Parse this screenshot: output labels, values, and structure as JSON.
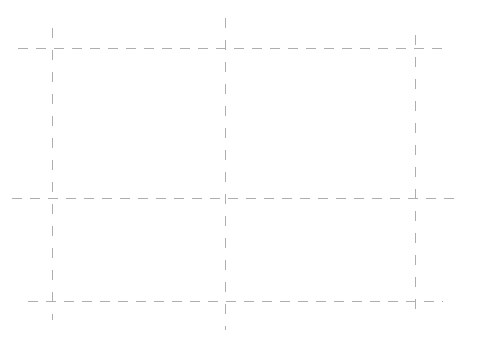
{
  "canvas": {
    "width": 477,
    "height": 347,
    "background_color": "#ffffff",
    "title": "Dashed Grid Overlay"
  },
  "grid": {
    "line_color": "#aeaeae",
    "line_width": 1,
    "horizontal_dash_pattern": "10 8",
    "vertical_dash_pattern": "10 12",
    "horizontal_line_count": 3,
    "vertical_line_count": 3,
    "horizontal_lines": [
      {
        "name": "horizontal-line-top",
        "y": 48,
        "x_start": 18,
        "x_end": 447
      },
      {
        "name": "horizontal-line-middle",
        "y": 198,
        "x_start": 12,
        "x_end": 458
      },
      {
        "name": "horizontal-line-bottom",
        "y": 301,
        "x_start": 28,
        "x_end": 443
      }
    ],
    "vertical_lines": [
      {
        "name": "vertical-line-left",
        "x": 52,
        "y_start": 28,
        "y_end": 320
      },
      {
        "name": "vertical-line-middle",
        "x": 225,
        "y_start": 18,
        "y_end": 330
      },
      {
        "name": "vertical-line-right",
        "x": 415,
        "y_start": 35,
        "y_end": 310
      }
    ],
    "intersections": [
      {
        "name": "intersection-top-left",
        "x": 52,
        "y": 48
      },
      {
        "name": "intersection-top-center",
        "x": 225,
        "y": 48
      },
      {
        "name": "intersection-top-right",
        "x": 415,
        "y": 48
      },
      {
        "name": "intersection-middle-left",
        "x": 52,
        "y": 198
      },
      {
        "name": "intersection-middle-center",
        "x": 225,
        "y": 198
      },
      {
        "name": "intersection-middle-right",
        "x": 415,
        "y": 198
      },
      {
        "name": "intersection-bottom-left",
        "x": 52,
        "y": 301
      },
      {
        "name": "intersection-bottom-center",
        "x": 225,
        "y": 301
      },
      {
        "name": "intersection-bottom-right",
        "x": 415,
        "y": 301
      }
    ]
  }
}
